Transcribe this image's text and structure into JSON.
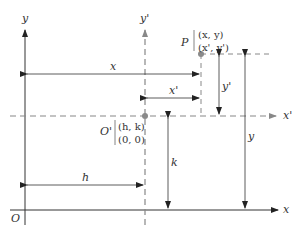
{
  "diagram": {
    "type": "coordinate-translation",
    "axes": {
      "original": {
        "x_label": "x",
        "y_label": "y",
        "origin_label": "O"
      },
      "translated": {
        "x_label": "x'",
        "y_label": "y'",
        "origin_label": "O'"
      }
    },
    "points": {
      "P": {
        "label": "P",
        "coords_original": "(x, y)",
        "coords_translated": "(x', y')"
      },
      "O_prime": {
        "label": "O'",
        "coords_original": "(h, k)",
        "coords_translated": "(0, 0)"
      }
    },
    "measurements": {
      "x": "x",
      "x_prime": "x'",
      "y": "y",
      "y_prime": "y'",
      "h": "h",
      "k": "k"
    },
    "colors": {
      "axis": "#333333",
      "dashed_axis": "#888888",
      "point": "#8a8a8a"
    }
  }
}
